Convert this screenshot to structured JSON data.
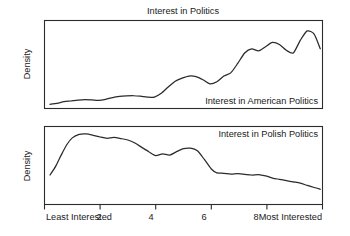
{
  "chart_data": {
    "type": "line",
    "title": "Interest in Politics",
    "xlabel": "",
    "ylabel": "Density",
    "grid": false,
    "legend": "none",
    "xlim": [
      0,
      10
    ],
    "xticks": [
      0,
      2,
      4,
      6,
      8,
      10
    ],
    "xtick_labels": [
      "Least Interested",
      "2",
      "4",
      "6",
      "8",
      "Most Interested"
    ],
    "panels": [
      {
        "label": "Interest in American Politics",
        "ylabel": "Density",
        "label_position": "bottom-right",
        "x": [
          0.2,
          0.45,
          0.7,
          0.95,
          1.2,
          1.45,
          1.7,
          1.95,
          2.2,
          2.45,
          2.7,
          2.95,
          3.2,
          3.45,
          3.7,
          3.95,
          4.2,
          4.45,
          4.7,
          4.95,
          5.2,
          5.45,
          5.7,
          5.95,
          6.2,
          6.45,
          6.7,
          6.95,
          7.2,
          7.45,
          7.7,
          7.95,
          8.2,
          8.45,
          8.7,
          8.95,
          9.2,
          9.45,
          9.7,
          9.92
        ],
        "y": [
          0.03,
          0.04,
          0.055,
          0.062,
          0.07,
          0.075,
          0.072,
          0.068,
          0.078,
          0.095,
          0.105,
          0.11,
          0.112,
          0.108,
          0.1,
          0.098,
          0.135,
          0.195,
          0.25,
          0.28,
          0.3,
          0.295,
          0.265,
          0.225,
          0.245,
          0.3,
          0.33,
          0.42,
          0.52,
          0.56,
          0.54,
          0.58,
          0.62,
          0.6,
          0.545,
          0.52,
          0.64,
          0.73,
          0.7,
          0.56
        ],
        "ylim": [
          0,
          0.82
        ]
      },
      {
        "label": "Interest in Polish Politics",
        "ylabel": "Density",
        "label_position": "top-right",
        "x": [
          0.2,
          0.4,
          0.6,
          0.8,
          1.0,
          1.25,
          1.5,
          1.75,
          2.0,
          2.25,
          2.5,
          2.75,
          3.0,
          3.25,
          3.5,
          3.75,
          4.0,
          4.25,
          4.5,
          4.75,
          5.0,
          5.25,
          5.5,
          5.75,
          6.0,
          6.2,
          6.45,
          6.7,
          6.95,
          7.2,
          7.45,
          7.7,
          7.95,
          8.2,
          8.45,
          8.7,
          8.95,
          9.2,
          9.45,
          9.7,
          9.92
        ],
        "y": [
          0.33,
          0.43,
          0.56,
          0.68,
          0.76,
          0.8,
          0.805,
          0.79,
          0.77,
          0.755,
          0.765,
          0.752,
          0.735,
          0.7,
          0.65,
          0.6,
          0.555,
          0.575,
          0.56,
          0.6,
          0.635,
          0.64,
          0.61,
          0.51,
          0.4,
          0.355,
          0.35,
          0.34,
          0.345,
          0.338,
          0.33,
          0.335,
          0.32,
          0.295,
          0.28,
          0.265,
          0.25,
          0.235,
          0.21,
          0.185,
          0.165
        ],
        "ylim": [
          0,
          0.88
        ]
      }
    ]
  },
  "figure": {
    "title": "Interest in Politics",
    "panel_top_label": "Interest in American Politics",
    "panel_bottom_label": "Interest in Polish Politics",
    "ylabel_top": "Density",
    "ylabel_bottom": "Density",
    "xtick_label_0": "Least Interested",
    "xtick_label_2": "2",
    "xtick_label_4": "4",
    "xtick_label_6": "6",
    "xtick_label_8": "8",
    "xtick_label_10": "Most Interested"
  },
  "colors": {
    "line": "#2b2b2b",
    "frame": "#2b2b2b",
    "background": "#ffffff",
    "text": "#1a1a1a"
  }
}
